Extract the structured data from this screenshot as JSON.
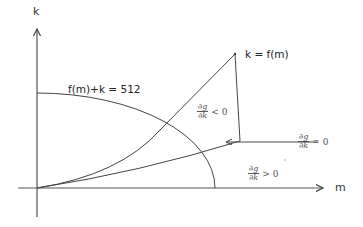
{
  "diagram": {
    "axes": {
      "x_label": "m",
      "y_label": "k"
    },
    "curves": {
      "budget_label": "f(m)+k = 512",
      "production_label": "k = f(m)"
    },
    "regions": [
      {
        "name": "negative",
        "num": "∂g",
        "den": "∂k",
        "rel": "< 0"
      },
      {
        "name": "zero",
        "num": "∂g",
        "den": "∂k",
        "rel": "= 0"
      },
      {
        "name": "positive",
        "num": "∂g",
        "den": "∂k",
        "rel": "> 0"
      }
    ],
    "colors": {
      "line": "#444444",
      "text": "#333333"
    }
  }
}
